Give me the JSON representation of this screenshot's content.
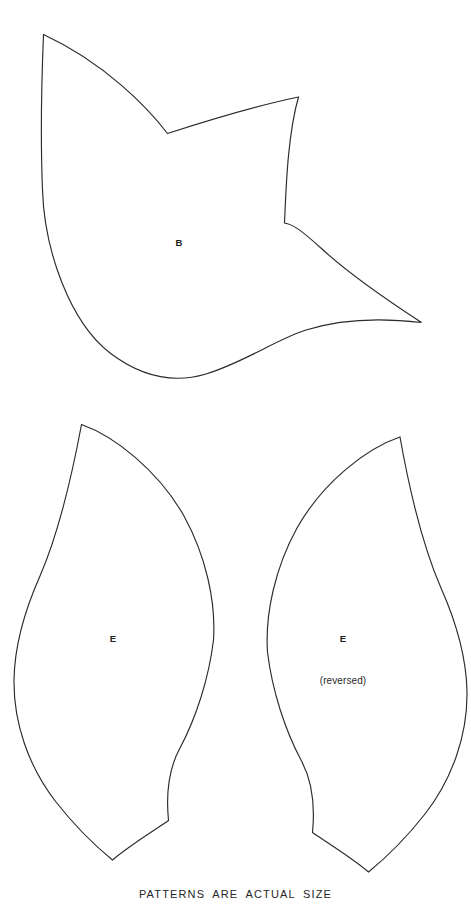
{
  "sheet": {
    "background_color": "#ffffff",
    "ink_color": "#2b2b2b",
    "width": 471,
    "height": 918,
    "footer_note": "PATTERNS ARE ACTUAL SIZE"
  },
  "pieces": [
    {
      "id": "piece-b",
      "label": "B",
      "sublabel": "",
      "label_x": 179,
      "label_y": 242,
      "shape_name": "tulip-blossom-pattern-piece",
      "path": "M 43.5 34.5 C 41.5 83 40.5 141 42.5 190 C 44.5 251 70 322 110 353 C 143 378 176 383 206 374 C 245 362 277 339 306 330 C 347 317 392 319 421.5 322.5 C 390 302 347 272 322 249 C 300 229 292 224 284.5 223.0 C 286.0 190 287.5 135 298.5 97.0 C 255 106 203 122 167.5 133.5 C 148 108 105 63 43.5 34.5 Z"
    },
    {
      "id": "piece-e-left",
      "label": "E",
      "sublabel": "",
      "label_x": 113,
      "label_y": 638,
      "shape_name": "leaf-pattern-piece",
      "path": "M 81.5 424.5 C 73 470 60 530 40 576 C 24 612 14.5 648 14.0 680 C 13.5 722 28 766 56 802 C 78 830 99 849 112.5 860.0 C 130 845 155 830 168.5 820.5 C 166 795 168 770 180 748 C 196 718 209 678 213.5 640.0 C 216 602 206 556 184 516 C 158 470 114 436 81.5 424.5 Z"
    },
    {
      "id": "piece-e-right",
      "label": "E",
      "sublabel": "(reversed)",
      "label_x": 343,
      "label_y": 638,
      "sublabel_x": 343,
      "sublabel_y": 680,
      "shape_name": "leaf-pattern-piece-reversed",
      "path": "M 400.0 437.0 C 367 448 323 482 297 528 C 275 568 265 614 267.5 652.0 C 272 690 285 730 301 760 C 313 782 315 807 312.5 832.5 C 326 842 351 857 368.5 872.0 C 382 861 403 842 425 814 C 453 778 467.5 734 467 692 C 466.5 660 457 624 441 588 C 421 542 408 482 400.0 437.0 Z"
    }
  ]
}
